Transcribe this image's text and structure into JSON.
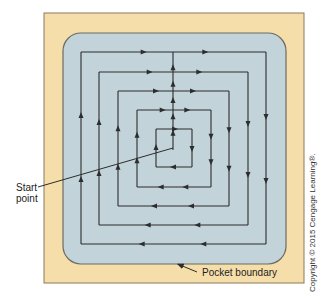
{
  "diagram": {
    "colors": {
      "outer_frame": "#f6deaa",
      "outer_frame_border": "#8a7a5a",
      "pocket_fill": "#c2d3da",
      "pocket_border": "#6b6b63",
      "path": "#2d2d2d"
    },
    "pocket": {
      "x": 63,
      "y": 33,
      "w": 223,
      "h": 231,
      "corner_radius": 18
    },
    "frame": {
      "x": 44,
      "y": 13,
      "w": 260,
      "h": 270
    },
    "center_line": {
      "x": 173,
      "y_start": 150,
      "y_end": 52,
      "direction": "up"
    },
    "loops": [
      {
        "left": 81,
        "top": 52,
        "right": 266,
        "bottom": 244
      },
      {
        "left": 99,
        "top": 72,
        "right": 248,
        "bottom": 225
      },
      {
        "left": 118,
        "top": 91,
        "right": 229,
        "bottom": 206
      },
      {
        "left": 137,
        "top": 110,
        "right": 211,
        "bottom": 187
      },
      {
        "left": 156,
        "top": 129,
        "right": 192,
        "bottom": 167
      }
    ],
    "direction_legend": {
      "top": "right",
      "right": "down",
      "bottom": "left",
      "left": "up"
    }
  },
  "labels": {
    "start_line1": "Start",
    "start_line2": "point",
    "pocket_boundary": "Pocket boundary",
    "copyright": "Copyright © 2015 Cengage Learning®."
  }
}
